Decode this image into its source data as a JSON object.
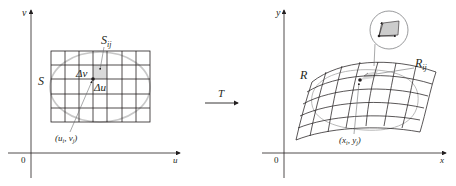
{
  "figure": {
    "left_panel": {
      "axis_horizontal_label": "u",
      "axis_vertical_label": "v",
      "origin_label": "0",
      "region_label": "S",
      "subrectangle_label": "S",
      "subrectangle_subscript": "ij",
      "delta_v_label": "Δv",
      "delta_u_label": "Δu",
      "point_label": "(u",
      "point_label_i": "i",
      "point_label_mid": ", v",
      "point_label_j": "j",
      "point_label_end": ")",
      "grid_columns": 7,
      "grid_rows": 5
    },
    "transformation": {
      "label": "T"
    },
    "right_panel": {
      "axis_horizontal_label": "x",
      "axis_vertical_label": "y",
      "origin_label": "0",
      "region_label": "R",
      "subregion_label": "R",
      "subregion_subscript": "ij",
      "point_label": "(x",
      "point_label_i": "i",
      "point_label_mid": ", y",
      "point_label_j": "j",
      "point_label_end": ")"
    },
    "colors": {
      "line": "#231f20",
      "ellipse": "#c8c8c8",
      "shade": "#d9d9d9",
      "leader": "#6d6e71"
    }
  }
}
